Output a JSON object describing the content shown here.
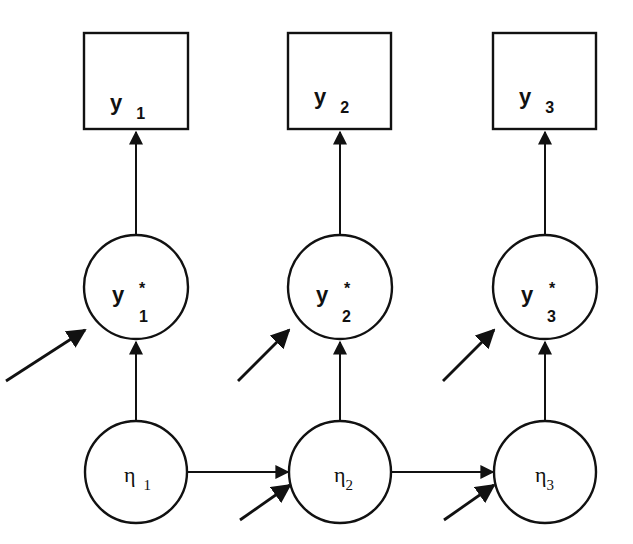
{
  "diagram": {
    "type": "path-diagram",
    "colors": {
      "stroke": "#111111",
      "background": "#ffffff"
    },
    "observed": [
      {
        "id": "y1",
        "label": "y",
        "subscript": "1"
      },
      {
        "id": "y2",
        "label": "y",
        "subscript": "2"
      },
      {
        "id": "y3",
        "label": "y",
        "subscript": "3"
      }
    ],
    "latent_response": [
      {
        "id": "ystar1",
        "label": "y",
        "superscript": "*",
        "subscript": "1"
      },
      {
        "id": "ystar2",
        "label": "y",
        "superscript": "*",
        "subscript": "2"
      },
      {
        "id": "ystar3",
        "label": "y",
        "superscript": "*",
        "subscript": "3"
      }
    ],
    "latent_factors": [
      {
        "id": "eta1",
        "label": "η",
        "subscript": "1"
      },
      {
        "id": "eta2",
        "label": "η",
        "subscript": "2"
      },
      {
        "id": "eta3",
        "label": "η",
        "subscript": "3"
      }
    ],
    "edges": [
      {
        "from": "ystar1",
        "to": "y1"
      },
      {
        "from": "ystar2",
        "to": "y2"
      },
      {
        "from": "ystar3",
        "to": "y3"
      },
      {
        "from": "eta1",
        "to": "ystar1"
      },
      {
        "from": "eta2",
        "to": "ystar2"
      },
      {
        "from": "eta3",
        "to": "ystar3"
      },
      {
        "from": "eta1",
        "to": "eta2"
      },
      {
        "from": "eta2",
        "to": "eta3"
      }
    ],
    "disturbances": [
      "ystar1",
      "ystar2",
      "ystar3",
      "eta2",
      "eta3"
    ]
  }
}
